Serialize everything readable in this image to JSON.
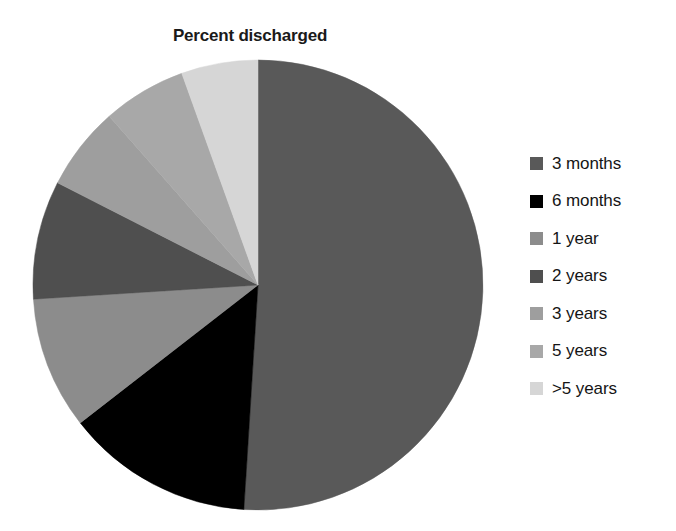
{
  "chart_data": {
    "type": "pie",
    "title": "Percent discharged",
    "xlabel": "",
    "ylabel": "",
    "legend_position": "right",
    "grid": false,
    "categories": [
      "3 months",
      "6 months",
      "1 year",
      "2 years",
      "3 years",
      "5 years",
      ">5 years"
    ],
    "values": [
      51.0,
      13.5,
      9.5,
      8.5,
      6.0,
      6.0,
      5.5
    ],
    "units": "percent",
    "start_angle_deg": 0,
    "direction": "clockwise",
    "slices": [
      {
        "label": "3 months",
        "value": 51.0,
        "color": "#595959",
        "start_deg": 0,
        "end_deg": 183.6
      },
      {
        "label": "6 months",
        "value": 13.5,
        "color": "#000000",
        "start_deg": 183.6,
        "end_deg": 232.2
      },
      {
        "label": "1 year",
        "value": 9.5,
        "color": "#8c8c8c",
        "start_deg": 232.2,
        "end_deg": 266.4
      },
      {
        "label": "2 years",
        "value": 8.5,
        "color": "#4f4f4f",
        "start_deg": 266.4,
        "end_deg": 297.0
      },
      {
        "label": "3 years",
        "value": 6.0,
        "color": "#9e9e9e",
        "start_deg": 297.0,
        "end_deg": 318.6
      },
      {
        "label": "5 years",
        "value": 6.0,
        "color": "#a8a8a8",
        "start_deg": 318.6,
        "end_deg": 340.2
      },
      {
        "label": ">5 years",
        "value": 5.5,
        "color": "#d6d6d6",
        "start_deg": 340.2,
        "end_deg": 360.0
      }
    ]
  },
  "title": "Percent discharged",
  "legend": {
    "items": [
      {
        "label": "3 months",
        "color": "#595959"
      },
      {
        "label": "6 months",
        "color": "#000000"
      },
      {
        "label": "1 year",
        "color": "#8c8c8c"
      },
      {
        "label": "2 years",
        "color": "#4f4f4f"
      },
      {
        "label": "3 years",
        "color": "#9e9e9e"
      },
      {
        "label": "5 years",
        "color": "#a8a8a8"
      },
      {
        "label": ">5 years",
        "color": "#d6d6d6"
      }
    ]
  }
}
